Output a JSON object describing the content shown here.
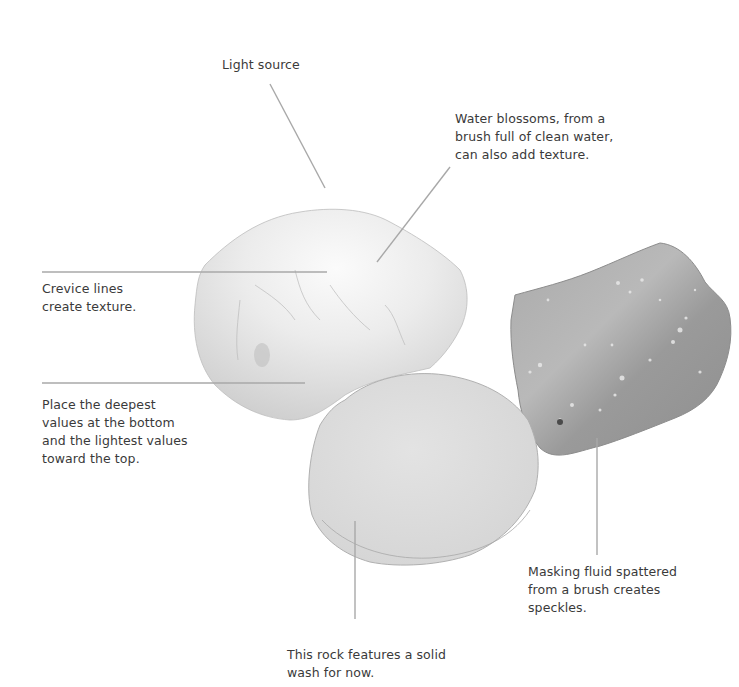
{
  "illustration": {
    "subject": "Three watercolor rocks with annotations",
    "colors": {
      "background": "#ffffff",
      "callout_line": "#a8a8a8",
      "text": "#3a3a3a",
      "rock_light": "#e6e6e6",
      "rock_mid": "#d2d2d2",
      "rock_dark": "#9a9a9a"
    }
  },
  "callouts": {
    "light_source": {
      "lines": [
        "Light source"
      ]
    },
    "water_blossoms": {
      "lines": [
        "Water blossoms, from a",
        "brush full of clean water,",
        "can also add texture."
      ]
    },
    "crevice_lines": {
      "lines": [
        "Crevice lines",
        "create texture."
      ]
    },
    "deepest_values": {
      "lines": [
        "Place the deepest",
        "values at the bottom",
        "and the lightest values",
        "toward the top."
      ]
    },
    "masking_fluid": {
      "lines": [
        "Masking fluid spattered",
        "from a brush creates",
        "speckles."
      ]
    },
    "solid_wash": {
      "lines": [
        "This rock features a solid",
        "wash for now."
      ]
    }
  }
}
